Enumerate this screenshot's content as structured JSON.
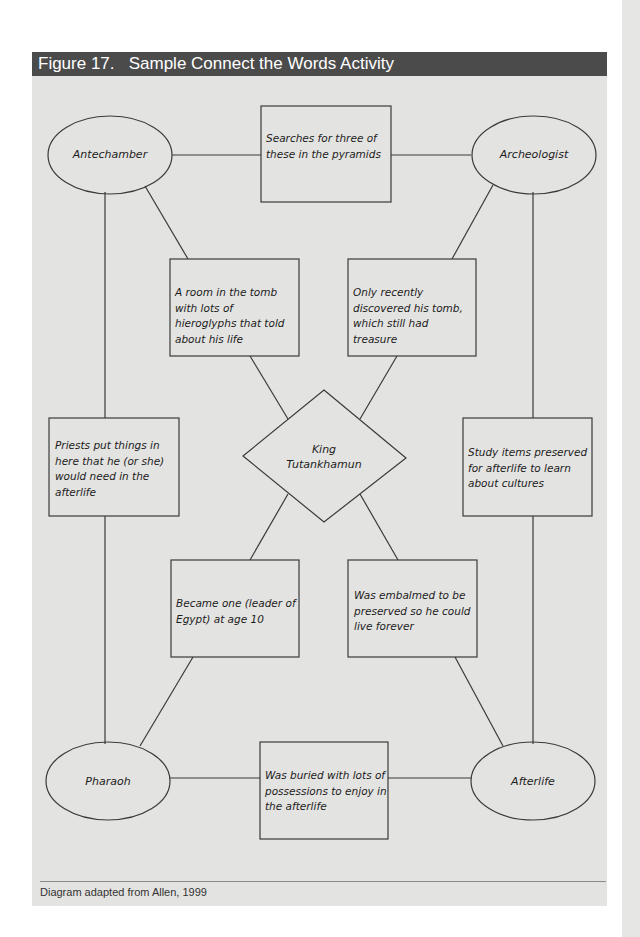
{
  "figure": {
    "title": "Figure 17.   Sample Connect the Words Activity",
    "caption": "Diagram adapted from Allen, 1999"
  },
  "colors": {
    "header_bg": "#4b4b4b",
    "panel_bg": "#e3e3e1",
    "stroke": "#3a3a3a"
  },
  "diagram": {
    "center": {
      "label_line1": "King",
      "label_line2": "Tutankhamun"
    },
    "ellipses": {
      "top_left": "Antechamber",
      "top_right": "Archeologist",
      "bottom_left": "Pharaoh",
      "bottom_right": "Afterlife"
    },
    "boxes": {
      "top": "Searches for three of these in the pyramids",
      "upper_left": "A room in the tomb with lots of hieroglyphs that told about his life",
      "upper_right": "Only recently discovered his tomb, which still had treasure",
      "left": "Priests put things in here that he (or she) would need in the afterlife",
      "right": "Study items preserved for afterlife to learn about cultures",
      "lower_left": "Became one (leader of Egypt) at age 10",
      "lower_right": "Was embalmed to be preserved so he could live forever",
      "bottom": "Was buried with lots of possessions to enjoy in the afterlife"
    }
  }
}
